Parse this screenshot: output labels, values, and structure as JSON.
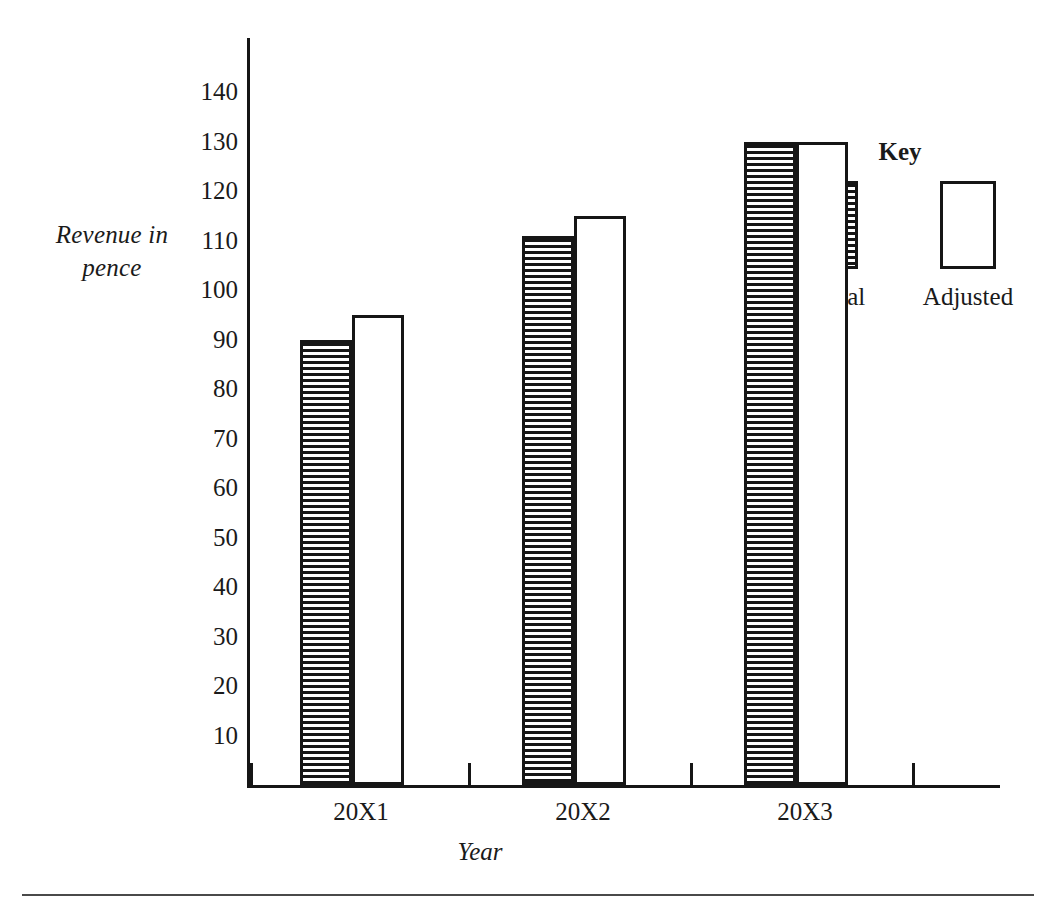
{
  "chart_data": {
    "type": "bar",
    "title": "",
    "xlabel": "Year",
    "ylabel": "Revenue in pence",
    "ylabel_lines": [
      "Revenue in",
      "pence"
    ],
    "categories": [
      "20X1",
      "20X2",
      "20X3"
    ],
    "series": [
      {
        "name": "Actual",
        "fill": "horizontal-hatch",
        "values": [
          90,
          111,
          130
        ]
      },
      {
        "name": "Adjusted",
        "fill": "white",
        "values": [
          95,
          115,
          130
        ]
      }
    ],
    "yticks": [
      10,
      20,
      30,
      40,
      50,
      60,
      70,
      80,
      90,
      100,
      110,
      120,
      130,
      140
    ],
    "ytick_labels": [
      "10",
      "20",
      "30",
      "40",
      "50",
      "60",
      "70",
      "80",
      "90",
      "100",
      "110",
      "120",
      "130",
      "140"
    ],
    "ylim": [
      0,
      148
    ],
    "grid": false,
    "legend": {
      "title": "Key",
      "position": "right",
      "entries": [
        {
          "label": "Actual",
          "fill": "horizontal-hatch"
        },
        {
          "label": "Adjusted",
          "fill": "white"
        }
      ]
    },
    "colors": {
      "ink": "#161616",
      "background": "#ffffff",
      "rule": "#4a4a4a"
    }
  }
}
